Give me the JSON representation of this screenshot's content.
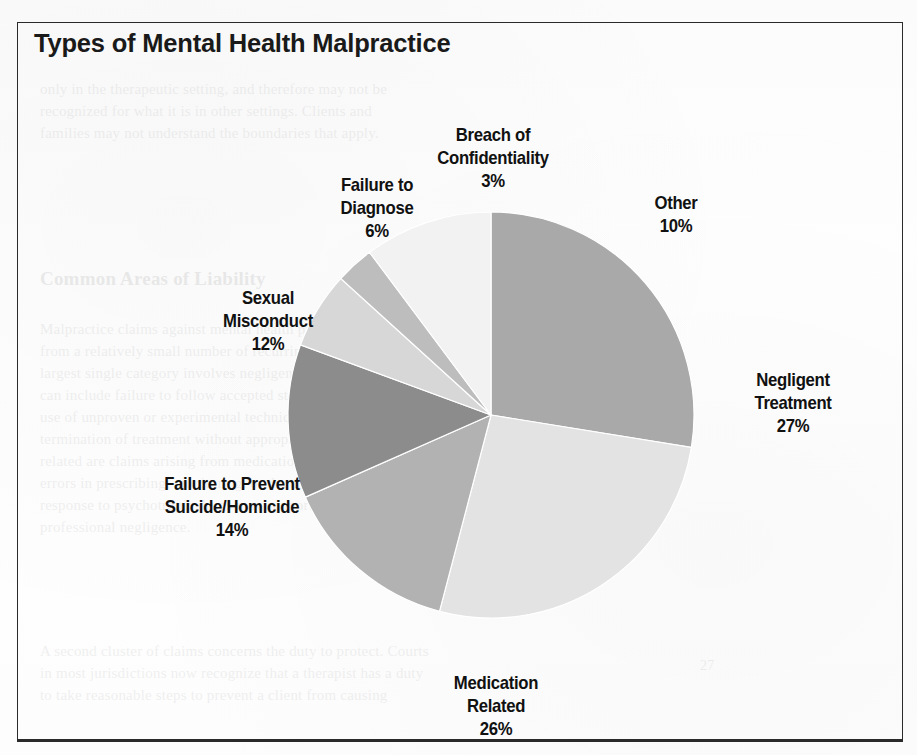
{
  "figure": {
    "title": "Types of Mental Health Malpractice"
  },
  "chart_data": {
    "type": "pie",
    "title": "Types of Mental Health Malpractice",
    "xlabel": "",
    "ylabel": "",
    "legend_position": "none",
    "grid": false,
    "units": "percent",
    "start_angle_deg": 0,
    "direction": "clockwise",
    "categories": [
      "Negligent Treatment",
      "Medication Related",
      "Failure to Prevent Suicide/Homicide",
      "Sexual Misconduct",
      "Failure to Diagnose",
      "Breach of Confidentiality",
      "Other"
    ],
    "values": [
      27,
      26,
      14,
      12,
      6,
      3,
      10
    ],
    "labels": [
      "Negligent\nTreatment",
      "Medication\nRelated",
      "Failure to Prevent\nSuicide/Homicide",
      "Sexual\nMisconduct",
      "Failure to\nDiagnose",
      "Breach of\nConfidentiality",
      "Other"
    ],
    "value_labels": [
      "27%",
      "26%",
      "14%",
      "12%",
      "6%",
      "3%",
      "10%"
    ],
    "colors": [
      "#a9a9a9",
      "#e3e3e3",
      "#b2b2b2",
      "#8c8c8c",
      "#d7d7d7",
      "#bdbdbd",
      "#f2f2f2"
    ]
  },
  "slices": {
    "negligent": {
      "name": "Negligent Treatment",
      "label": "Negligent\nTreatment",
      "pct": "27%",
      "value": 27,
      "color": "#a9a9a9"
    },
    "medication": {
      "name": "Medication Related",
      "label": "Medication\nRelated",
      "pct": "26%",
      "value": 26,
      "color": "#e3e3e3"
    },
    "suicide": {
      "name": "Failure to Prevent Suicide/Homicide",
      "label": "Failure to Prevent\nSuicide/Homicide",
      "pct": "14%",
      "value": 14,
      "color": "#b2b2b2"
    },
    "sexual": {
      "name": "Sexual Misconduct",
      "label": "Sexual\nMisconduct",
      "pct": "12%",
      "value": 12,
      "color": "#8c8c8c"
    },
    "diagnose": {
      "name": "Failure to Diagnose",
      "label": "Failure to\nDiagnose",
      "pct": "6%",
      "value": 6,
      "color": "#d7d7d7"
    },
    "breach": {
      "name": "Breach of Confidentiality",
      "label": "Breach of\nConfidentiality",
      "pct": "3%",
      "value": 3,
      "color": "#bdbdbd"
    },
    "other": {
      "name": "Other",
      "label": "Other",
      "pct": "10%",
      "value": 10,
      "color": "#f2f2f2"
    }
  },
  "ghost_text": {
    "top": "only in the therapeutic setting, and therefore may not be\nrecognized for what it is in other settings. Clients and\nfamilies may not understand the boundaries that apply.",
    "heading": "Common Areas of Liability",
    "body": "Malpractice claims against mental health professionals arise\nfrom a relatively small number of recurring situations. The\nlargest single category involves negligent treatment, which\ncan include failure to follow accepted standards of care, the\nuse of unproven or experimental techniques, and abrupt\ntermination of treatment without appropriate referral. Closely\nrelated are claims arising from medication management, where\nerrors in prescribing, monitoring, or documenting a client's\nresponse to psychotropic drugs may support a claim of\nprofessional negligence.",
    "body2": "A second cluster of claims concerns the duty to protect. Courts\nin most jurisdictions now recognize that a therapist has a duty\nto take reasonable steps to prevent a client from causing",
    "right": "27"
  }
}
